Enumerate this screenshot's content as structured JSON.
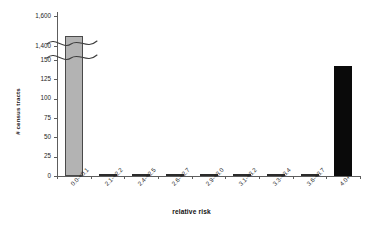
{
  "chart_data": {
    "type": "bar",
    "title": "",
    "xlabel": "relative risk",
    "ylabel": "# census tracts",
    "categories": [
      "0.0-<0.1",
      "2.1-<2.2",
      "2.4-<2.5",
      "2.6-<2.7",
      "2.9-<3.0",
      "3.1-<3.2",
      "3.3-<3.4",
      "3.6-<3.7",
      "4.0+"
    ],
    "values": [
      1470,
      1,
      1,
      1,
      1,
      1,
      1,
      2,
      142
    ],
    "bar_colors": [
      "#b3b3b3",
      "#2b2b2b",
      "#2b2b2b",
      "#2b2b2b",
      "#2b2b2b",
      "#2b2b2b",
      "#2b2b2b",
      "#2b2b2b",
      "#0a0a0a"
    ],
    "yticks_lower": [
      0,
      25,
      50,
      75,
      100,
      125,
      150
    ],
    "yticks_upper": [
      "1,400",
      "1,600"
    ],
    "ylim_lower": [
      0,
      150
    ],
    "ylim_upper": [
      1400,
      1600
    ],
    "axis_break": true,
    "axis_break_note": "y-axis broken between 150 and 1,400",
    "grid": false,
    "legend": "none"
  },
  "axis": {
    "y_title": "# census tracts",
    "x_title": "relative risk",
    "y_labels": [
      "1,600",
      "1,400",
      "150",
      "125",
      "100",
      "75",
      "50",
      "25",
      "0"
    ],
    "x_labels": [
      "0.0-<0.1",
      "2.1-<2.2",
      "2.4-<2.5",
      "2.6-<2.7",
      "2.9-<3.0",
      "3.1-<3.2",
      "3.3-<3.4",
      "3.6-<3.7",
      "4.0+"
    ]
  },
  "colors": {
    "bar_gray": "#b3b3b3",
    "bar_black": "#0a0a0a",
    "axis": "#5d5d5d",
    "text": "#1d1d1d",
    "background": "#ffffff"
  }
}
